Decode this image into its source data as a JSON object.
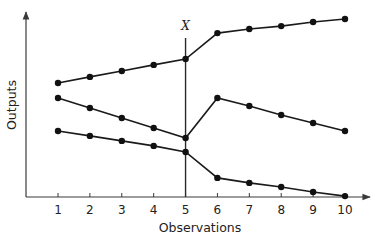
{
  "chart_data": {
    "type": "line",
    "title": "",
    "xlabel": "Observations",
    "ylabel": "Outputs",
    "x": [
      1,
      2,
      3,
      4,
      5,
      6,
      7,
      8,
      9,
      10
    ],
    "xticks": [
      "1",
      "2",
      "3",
      "4",
      "5",
      "6",
      "7",
      "8",
      "9",
      "10"
    ],
    "yticks": [],
    "ylim": [
      0,
      100
    ],
    "grid": false,
    "legend": null,
    "annotations": [
      {
        "type": "vertical_line",
        "x": 5,
        "label": "X"
      }
    ],
    "series": [
      {
        "name": "Series A (upper)",
        "values": [
          61.6,
          64.9,
          68.1,
          71.4,
          74.6,
          88.6,
          90.8,
          92.4,
          94.6,
          96.2
        ]
      },
      {
        "name": "Series B (middle)",
        "values": [
          53.5,
          48.1,
          42.7,
          37.3,
          31.9,
          53.5,
          49.2,
          44.3,
          40.0,
          35.7
        ]
      },
      {
        "name": "Series C (lower)",
        "values": [
          35.7,
          33.0,
          30.3,
          27.6,
          24.3,
          10.3,
          7.6,
          5.4,
          2.7,
          0.5
        ]
      }
    ],
    "note": "Y-axis has no numeric tick labels; values are relative estimates on a 0-100 scale read from pixel positions."
  },
  "labels": {
    "xlabel": "Observations",
    "ylabel": "Outputs",
    "marker": "X"
  },
  "colors": {
    "line": "#1a1a1a",
    "axis": "#3a3a3a",
    "background": "#ffffff"
  }
}
